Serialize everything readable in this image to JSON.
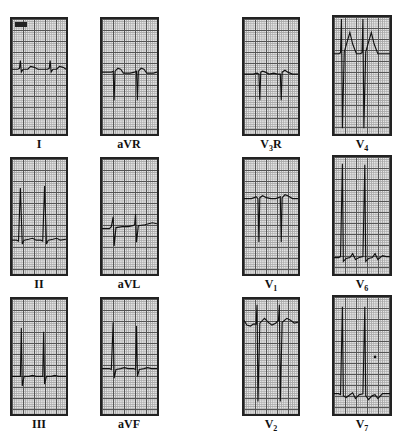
{
  "figure": {
    "leads": [
      {
        "id": "I",
        "label": "I",
        "col": 0,
        "row": 0,
        "trace": "small-upright-qrs"
      },
      {
        "id": "II",
        "label": "II",
        "col": 0,
        "row": 1,
        "trace": "tall-upright-qrs"
      },
      {
        "id": "III",
        "label": "III",
        "col": 0,
        "row": 2,
        "trace": "tall-upright-qrs-with-s"
      },
      {
        "id": "aVR",
        "label": "aVR",
        "col": 1,
        "row": 0,
        "trace": "negative-qrs"
      },
      {
        "id": "aVL",
        "label": "aVL",
        "col": 1,
        "row": 1,
        "trace": "biphasic-small"
      },
      {
        "id": "aVF",
        "label": "aVF",
        "col": 1,
        "row": 2,
        "trace": "tall-upright-qrs"
      },
      {
        "id": "V3R",
        "label": "V",
        "sub": "3",
        "suffix": "R",
        "col": 2,
        "row": 0,
        "trace": "negative-qrs"
      },
      {
        "id": "V1",
        "label": "V",
        "sub": "1",
        "suffix": "",
        "col": 2,
        "row": 1,
        "trace": "deep-negative-qrs"
      },
      {
        "id": "V2",
        "label": "V",
        "sub": "2",
        "suffix": "",
        "col": 2,
        "row": 2,
        "trace": "deep-rs"
      },
      {
        "id": "V4",
        "label": "V",
        "sub": "4",
        "suffix": "",
        "col": 3,
        "row": 0,
        "trace": "deep-s-peaked-t"
      },
      {
        "id": "V6",
        "label": "V",
        "sub": "6",
        "suffix": "",
        "col": 3,
        "row": 1,
        "trace": "very-tall-r"
      },
      {
        "id": "V7",
        "label": "V",
        "sub": "7",
        "suffix": "",
        "col": 3,
        "row": 2,
        "trace": "very-tall-r"
      }
    ]
  },
  "labels": {
    "I": "I",
    "II": "II",
    "III": "III",
    "aVR": "aVR",
    "aVL": "aVL",
    "aVF": "aVF",
    "V3R_base": "V",
    "V3R_sub": "3",
    "V3R_suffix": "R",
    "V1_base": "V",
    "V1_sub": "1",
    "V2_base": "V",
    "V2_sub": "2",
    "V4_base": "V",
    "V4_sub": "4",
    "V6_base": "V",
    "V6_sub": "6",
    "V7_base": "V",
    "V7_sub": "7"
  },
  "colors": {
    "grid_major": "#555555",
    "grid_minor": "#aaaaaa",
    "paper": "#e6e6e6",
    "trace": "#111111",
    "frame": "#222222"
  }
}
